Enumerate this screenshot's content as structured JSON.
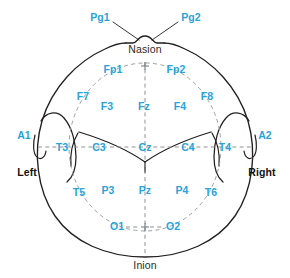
{
  "diagram": {
    "colors": {
      "electrode_label": "#29a3dc",
      "landmark_label": "#2b2b2b",
      "side_label": "#111111",
      "outline": "#231f20",
      "dashed_grid": "#8d9194",
      "background": "#ffffff"
    },
    "landmarks": [
      {
        "label": "Nasion",
        "x": 145,
        "y": 49
      },
      {
        "label": "Inion",
        "x": 145,
        "y": 265
      }
    ],
    "sides": [
      {
        "label": "Left",
        "x": 27,
        "y": 172
      },
      {
        "label": "Right",
        "x": 262,
        "y": 172
      }
    ],
    "electrodes": [
      {
        "label": "Pg1",
        "x": 100,
        "y": 17
      },
      {
        "label": "Pg2",
        "x": 191,
        "y": 17
      },
      {
        "label": "Fp1",
        "x": 113,
        "y": 69
      },
      {
        "label": "Fp2",
        "x": 176,
        "y": 69
      },
      {
        "label": "F7",
        "x": 83,
        "y": 96
      },
      {
        "label": "F3",
        "x": 107,
        "y": 106
      },
      {
        "label": "Fz",
        "x": 144,
        "y": 106
      },
      {
        "label": "F4",
        "x": 180,
        "y": 106
      },
      {
        "label": "F8",
        "x": 207,
        "y": 96
      },
      {
        "label": "A1",
        "x": 24,
        "y": 135
      },
      {
        "label": "T3",
        "x": 62,
        "y": 147
      },
      {
        "label": "C3",
        "x": 99,
        "y": 147
      },
      {
        "label": "Cz",
        "x": 145,
        "y": 147
      },
      {
        "label": "C4",
        "x": 188,
        "y": 147
      },
      {
        "label": "T4",
        "x": 225,
        "y": 147
      },
      {
        "label": "A2",
        "x": 265,
        "y": 135
      },
      {
        "label": "T5",
        "x": 79,
        "y": 192
      },
      {
        "label": "P3",
        "x": 108,
        "y": 190
      },
      {
        "label": "Pz",
        "x": 145,
        "y": 190
      },
      {
        "label": "P4",
        "x": 182,
        "y": 190
      },
      {
        "label": "T6",
        "x": 211,
        "y": 192
      },
      {
        "label": "O1",
        "x": 117,
        "y": 226
      },
      {
        "label": "O2",
        "x": 173,
        "y": 226
      }
    ]
  }
}
